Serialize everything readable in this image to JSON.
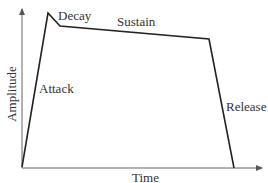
{
  "diagram": {
    "axes": {
      "x_label": "Time",
      "y_label": "Amplitude"
    },
    "phases": [
      {
        "name": "Attack",
        "label": "Attack"
      },
      {
        "name": "Decay",
        "label": "Decay"
      },
      {
        "name": "Sustain",
        "label": "Sustain"
      },
      {
        "name": "Release",
        "label": "Release"
      }
    ],
    "envelope_points": [
      [
        22,
        167
      ],
      [
        48,
        13
      ],
      [
        60,
        26
      ],
      [
        209,
        39
      ],
      [
        234,
        168
      ]
    ],
    "colors": {
      "line": "#222222",
      "axis": "#555555",
      "background": "#ffffff"
    }
  }
}
